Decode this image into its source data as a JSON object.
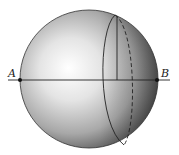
{
  "diagram": {
    "type": "sphere-with-cross-section",
    "labels": {
      "point_a": "A",
      "point_b": "B"
    },
    "colors": {
      "stroke": "#222222",
      "sphere_light": "#ffffff",
      "sphere_mid": "#b8b8b8",
      "sphere_dark": "#4a4a4a"
    }
  }
}
